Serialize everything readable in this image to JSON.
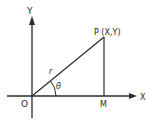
{
  "diagram": {
    "type": "polar-coordinates",
    "labels": {
      "y_axis": "Y",
      "x_axis": "X",
      "origin": "O",
      "point": "P (X,Y)",
      "foot": "M",
      "radius": "r",
      "angle": "θ"
    },
    "colors": {
      "line": "#2a2a2a",
      "background": "#ffffff"
    }
  }
}
